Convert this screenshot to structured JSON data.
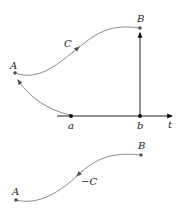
{
  "top_diagram": {
    "points": {
      "A": "A",
      "B": "B",
      "C": "C"
    },
    "axis": {
      "label": "t",
      "ticks": [
        "a",
        "b"
      ]
    }
  },
  "bottom_diagram": {
    "points": {
      "A": "A",
      "B": "B",
      "C": "−C"
    }
  },
  "colors": {
    "curve": "#8a8a8a",
    "axis": "#222222"
  }
}
